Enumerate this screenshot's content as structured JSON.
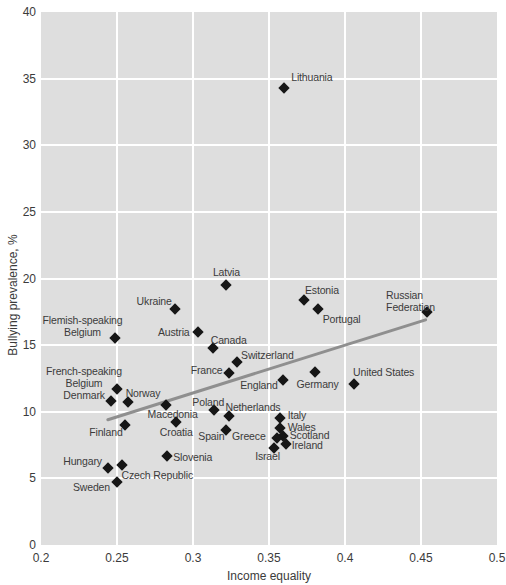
{
  "chart_data": {
    "type": "scatter",
    "title": "",
    "xlabel": "Income equality",
    "ylabel": "Bullying prevalence, %",
    "xlim": [
      0.2,
      0.5
    ],
    "ylim": [
      0,
      40
    ],
    "x_ticks": [
      "0.2",
      "0.25",
      "0.3",
      "0.35",
      "0.4",
      "0.45",
      "0.5"
    ],
    "y_ticks": [
      "0",
      "5",
      "10",
      "15",
      "20",
      "25",
      "30",
      "35",
      "40"
    ],
    "grid": true,
    "legend": "none",
    "marker": "diamond",
    "colors": {
      "plot_bg": "#dedede",
      "grid": "#ffffff",
      "point": "#161616",
      "trend": "#8f8f8f",
      "text": "#3b3b3b"
    },
    "trend_line": {
      "x1": 0.244,
      "y1": 9.4,
      "x2": 0.453,
      "y2": 16.9
    },
    "points": [
      {
        "label": "Lithuania",
        "x": 0.36,
        "y": 34.3,
        "label_dx": 7,
        "label_dy": -11,
        "align": "left"
      },
      {
        "label": "Latvia",
        "x": 0.322,
        "y": 19.5,
        "label_dx": 0,
        "label_dy": -13,
        "align": "center"
      },
      {
        "label": "Estonia",
        "x": 0.373,
        "y": 18.4,
        "label_dx": 1,
        "label_dy": -10,
        "align": "left"
      },
      {
        "label": "Ukraine",
        "x": 0.288,
        "y": 17.7,
        "label_dx": -3,
        "label_dy": -8,
        "align": "right"
      },
      {
        "label": "Portugal",
        "x": 0.382,
        "y": 17.7,
        "label_dx": 5,
        "label_dy": 10,
        "align": "left"
      },
      {
        "label": "Russian Federation",
        "x": 0.454,
        "y": 17.5,
        "label_dx": -4,
        "label_dy": -11,
        "align": "center"
      },
      {
        "label": "Austria",
        "x": 0.303,
        "y": 16.0,
        "label_dx": -8,
        "label_dy": 0,
        "align": "right"
      },
      {
        "label": "Flemish-speaking\nBelgium",
        "x": 0.249,
        "y": 15.5,
        "label_dx": 7,
        "label_dy": -12,
        "align": "right"
      },
      {
        "label": "Canada",
        "x": 0.313,
        "y": 14.8,
        "label_dx": -2,
        "label_dy": -8,
        "align": "left"
      },
      {
        "label": "Switzerland",
        "x": 0.329,
        "y": 13.7,
        "label_dx": 4,
        "label_dy": -7,
        "align": "left"
      },
      {
        "label": "France",
        "x": 0.324,
        "y": 12.9,
        "label_dx": -7,
        "label_dy": -3,
        "align": "right"
      },
      {
        "label": "Germany",
        "x": 0.38,
        "y": 13.0,
        "label_dx": 3,
        "label_dy": 12,
        "align": "center"
      },
      {
        "label": "England",
        "x": 0.359,
        "y": 12.4,
        "label_dx": -5,
        "label_dy": 5,
        "align": "right"
      },
      {
        "label": "United States",
        "x": 0.406,
        "y": 12.1,
        "label_dx": -1,
        "label_dy": -12,
        "align": "left"
      },
      {
        "label": "French-speaking\nBelgium",
        "x": 0.25,
        "y": 11.7,
        "label_dx": 5,
        "label_dy": -12,
        "align": "right"
      },
      {
        "label": "Denmark",
        "x": 0.246,
        "y": 10.8,
        "label_dx": -6,
        "label_dy": -6,
        "align": "right"
      },
      {
        "label": "Norway",
        "x": 0.257,
        "y": 10.7,
        "label_dx": -2,
        "label_dy": -9,
        "align": "left"
      },
      {
        "label": "Macedonia",
        "x": 0.282,
        "y": 10.5,
        "label_dx": 7,
        "label_dy": 9,
        "align": "center"
      },
      {
        "label": "Poland",
        "x": 0.314,
        "y": 10.1,
        "label_dx": -6,
        "label_dy": -8,
        "align": "center"
      },
      {
        "label": "Netherlands",
        "x": 0.324,
        "y": 9.7,
        "label_dx": -4,
        "label_dy": -9,
        "align": "left"
      },
      {
        "label": "Croatia",
        "x": 0.289,
        "y": 9.2,
        "label_dx": 0,
        "label_dy": 10,
        "align": "center"
      },
      {
        "label": "Finland",
        "x": 0.255,
        "y": 9.0,
        "label_dx": -2,
        "label_dy": 7,
        "align": "right"
      },
      {
        "label": "Spain",
        "x": 0.322,
        "y": 8.6,
        "label_dx": -2,
        "label_dy": 6,
        "align": "right"
      },
      {
        "label": "Italy",
        "x": 0.357,
        "y": 9.5,
        "label_dx": 8,
        "label_dy": -3,
        "align": "left"
      },
      {
        "label": "Wales",
        "x": 0.357,
        "y": 8.8,
        "label_dx": 8,
        "label_dy": -1,
        "align": "left"
      },
      {
        "label": "Scotland",
        "x": 0.359,
        "y": 8.2,
        "label_dx": 7,
        "label_dy": -1,
        "align": "left"
      },
      {
        "label": "Greece",
        "x": 0.355,
        "y": 8.0,
        "label_dx": -11,
        "label_dy": -2,
        "align": "right"
      },
      {
        "label": "Ireland",
        "x": 0.361,
        "y": 7.6,
        "label_dx": 6,
        "label_dy": 1,
        "align": "left"
      },
      {
        "label": "Israel",
        "x": 0.353,
        "y": 7.3,
        "label_dx": -6,
        "label_dy": 8,
        "align": "center"
      },
      {
        "label": "Slovenia",
        "x": 0.283,
        "y": 6.7,
        "label_dx": 6,
        "label_dy": 1,
        "align": "left"
      },
      {
        "label": "Hungary",
        "x": 0.244,
        "y": 5.8,
        "label_dx": -6,
        "label_dy": -7,
        "align": "right"
      },
      {
        "label": "Czech Republic",
        "x": 0.253,
        "y": 6.0,
        "label_dx": 0,
        "label_dy": 10,
        "align": "left"
      },
      {
        "label": "Sweden",
        "x": 0.25,
        "y": 4.7,
        "label_dx": -7,
        "label_dy": 5,
        "align": "right"
      }
    ]
  }
}
